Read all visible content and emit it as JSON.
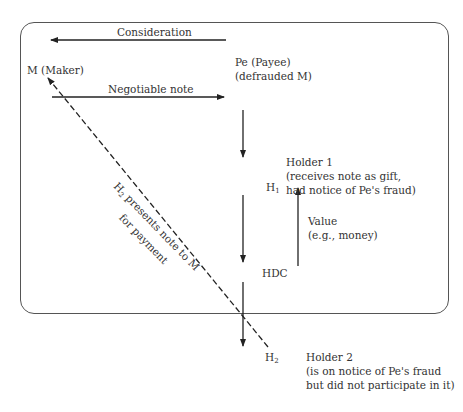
{
  "diagram": {
    "nodes": {
      "maker": "M (Maker)",
      "payee_line1": "Pe (Payee)",
      "payee_line2": "(defrauded M)",
      "h1": "H",
      "h1_sub": "1",
      "hdc": "HDC",
      "h2": "H",
      "h2_sub": "2"
    },
    "edges": {
      "consideration": "Consideration",
      "negotiable_note": "Negotiable note",
      "presents_line1": "presents note to M",
      "presents_prefix": "H",
      "presents_sub": "2",
      "presents_line2": "for payment",
      "value_line1": "Value",
      "value_line2": "(e.g., money)"
    },
    "annotations": {
      "holder1_title": "Holder 1",
      "holder1_line1": "(receives note as gift,",
      "holder1_line2": "had notice of Pe's fraud)",
      "holder2_title": "Holder 2",
      "holder2_line1": "(is on notice of Pe's fraud",
      "holder2_line2": "but did not participate in it)"
    }
  }
}
